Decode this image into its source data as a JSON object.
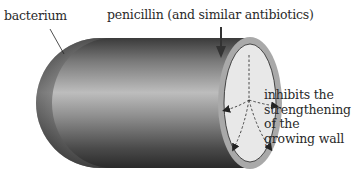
{
  "labels": {
    "bacterium": "bacterium",
    "antibiotic": "penicillin (and similar antibiotics)",
    "effect": "inhibits the strengthening of the growing wall"
  },
  "colors": {
    "body_dark": "#2e2e2e",
    "body_light": "#c8c8c8",
    "wall_ring": "#a9a9a9",
    "cross_section": "#e6e6e6",
    "arrow": "#333333",
    "text": "#2a2a2a"
  }
}
